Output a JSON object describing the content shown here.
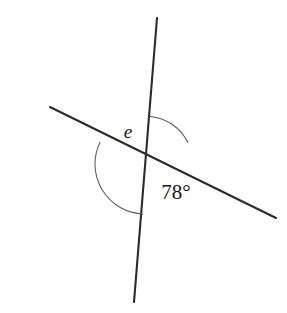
{
  "figure": {
    "background_color": "#ffffff",
    "line_color": "#2b2b2b",
    "arc_color": "#5a5a5a",
    "label_color": "#161616",
    "width": 287,
    "height": 313
  },
  "intersection": {
    "label": "intersection-point",
    "x": 145,
    "y": 164
  },
  "lines": [
    {
      "name": "steep-line",
      "description": "near-vertical line leaning right at top",
      "x1": 157,
      "y1": 18,
      "x2": 134,
      "y2": 302
    },
    {
      "name": "shallow-line",
      "description": "gently descending line from upper-left to lower-right",
      "x1": 50,
      "y1": 107,
      "x2": 276,
      "y2": 218
    }
  ],
  "angles": [
    {
      "name": "angle-e",
      "label": "e",
      "kind": "variable",
      "position": "upper-left",
      "radius": 50,
      "start_deg": 153.8,
      "end_deg": 267.6,
      "label_x": 128,
      "label_y": 134
    },
    {
      "name": "angle-78",
      "label": "78°",
      "kind": "measure",
      "value": 78,
      "unit": "degrees",
      "position": "lower-right",
      "radius": 48,
      "start_deg": 85.4,
      "end_deg": 26.2,
      "label_x": 176,
      "label_y": 194
    }
  ]
}
